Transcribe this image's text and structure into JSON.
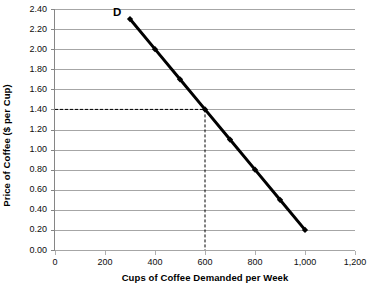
{
  "chart_data": {
    "type": "line",
    "title": "",
    "subtitle": "",
    "xlabel": "Cups of Coffee Demanded per Week",
    "ylabel": "Price of Coffee ($ per Cup)",
    "xlim": [
      0,
      1200
    ],
    "ylim": [
      0.0,
      2.4
    ],
    "grid": "horizontal",
    "legend": "none",
    "series": [
      {
        "name": "D",
        "label": "D",
        "marker": "diamond",
        "color": "#000000",
        "x": [
          300,
          400,
          500,
          600,
          700,
          800,
          900,
          1000
        ],
        "values": [
          2.3,
          2.0,
          1.7,
          1.4,
          1.1,
          0.8,
          0.5,
          0.2
        ]
      }
    ],
    "x_ticks": [
      {
        "value": 0,
        "label": "0"
      },
      {
        "value": 200,
        "label": "200"
      },
      {
        "value": 400,
        "label": "400"
      },
      {
        "value": 600,
        "label": "600"
      },
      {
        "value": 800,
        "label": "800"
      },
      {
        "value": 1000,
        "label": "1,000"
      },
      {
        "value": 1200,
        "label": "1,200"
      }
    ],
    "y_ticks": [
      {
        "value": 2.4,
        "label": "2.40"
      },
      {
        "value": 2.2,
        "label": "2.20"
      },
      {
        "value": 2.0,
        "label": "2.00"
      },
      {
        "value": 1.8,
        "label": "1.80"
      },
      {
        "value": 1.6,
        "label": "1.60"
      },
      {
        "value": 1.4,
        "label": "1.40"
      },
      {
        "value": 1.2,
        "label": "1.20"
      },
      {
        "value": 1.0,
        "label": "1.00"
      },
      {
        "value": 0.8,
        "label": "0.80"
      },
      {
        "value": 0.6,
        "label": "0.60"
      },
      {
        "value": 0.4,
        "label": "0.40"
      },
      {
        "value": 0.2,
        "label": "0.20"
      },
      {
        "value": 0.0,
        "label": "0.00"
      }
    ],
    "annotations": [
      {
        "name": "equilibrium-guide",
        "type": "dashed-guide",
        "x": 600,
        "y": 1.4,
        "style": "dashed",
        "color": "#000000"
      }
    ],
    "colors": {
      "series": "#000000",
      "gridline": "#a6a6a6",
      "axis": "#868686",
      "background": "#ffffff",
      "text": "#0d0d0d"
    }
  }
}
